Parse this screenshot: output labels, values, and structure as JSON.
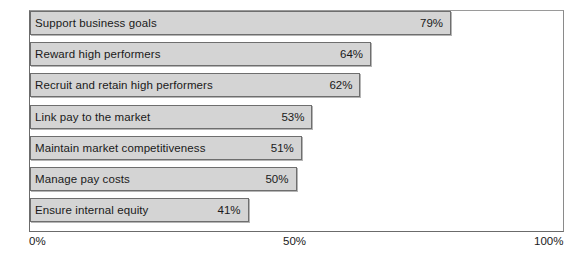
{
  "chart_data": {
    "type": "bar",
    "orientation": "horizontal",
    "title": "",
    "xlabel": "",
    "ylabel": "",
    "xlim": [
      0,
      100
    ],
    "grid": false,
    "legend": false,
    "categories": [
      "Support business goals",
      "Reward high performers",
      "Recruit and retain high performers",
      "Link pay to the market",
      "Maintain market competitiveness",
      "Manage pay costs",
      "Ensure internal equity"
    ],
    "values": [
      79,
      64,
      62,
      53,
      51,
      50,
      41
    ],
    "value_labels": [
      "79%",
      "64%",
      "62%",
      "53%",
      "51%",
      "50%",
      "41%"
    ],
    "tick_labels": [
      "0%",
      "50%",
      "100%"
    ],
    "tick_values": [
      0,
      50,
      100
    ],
    "colors": {
      "bar_fill": "#d4d4d4",
      "bar_border": "#6e6e6e",
      "axis": "#6b6b6b",
      "text": "#1a1a1a",
      "background": "#ffffff"
    }
  }
}
